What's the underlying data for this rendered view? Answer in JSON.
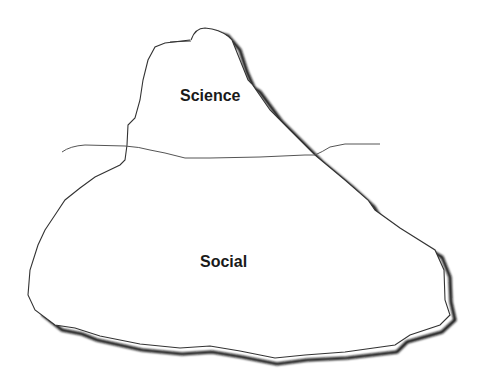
{
  "diagram": {
    "type": "iceberg",
    "labels": {
      "above_water": "Science",
      "below_water": "Social"
    },
    "colors": {
      "background": "#ffffff",
      "outline": "#333333",
      "shadow": "#111111",
      "text": "#1a1a1a"
    }
  }
}
